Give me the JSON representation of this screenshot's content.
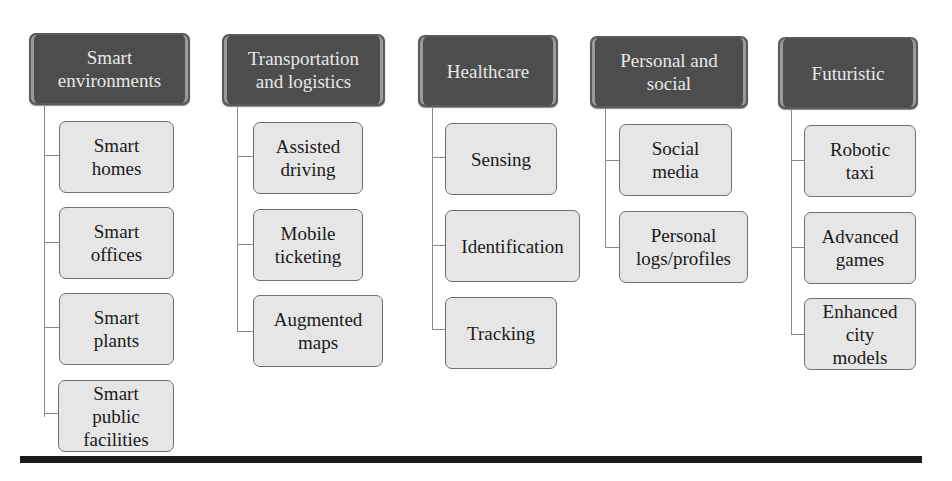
{
  "diagram": {
    "type": "category-tree",
    "columns": [
      {
        "title": "Smart\nenvironments",
        "items": [
          "Smart\nhomes",
          "Smart\noffices",
          "Smart\nplants",
          "Smart\npublic\nfacilities"
        ]
      },
      {
        "title": "Transportation\nand logistics",
        "items": [
          "Assisted\ndriving",
          "Mobile\nticketing",
          "Augmented\nmaps"
        ]
      },
      {
        "title": "Healthcare",
        "items": [
          "Sensing",
          "Identification",
          "Tracking"
        ]
      },
      {
        "title": "Personal and\nsocial",
        "items": [
          "Social\nmedia",
          "Personal\nlogs/profiles"
        ]
      },
      {
        "title": "Futuristic",
        "items": [
          "Robotic\ntaxi",
          "Advanced\ngames",
          "Enhanced\ncity\nmodels"
        ]
      }
    ]
  },
  "colors": {
    "header_bg": "#4d4d4d",
    "header_text": "#e8e8e8",
    "child_bg": "#e6e6e6",
    "child_border": "#6f6f6f",
    "connector": "#8a8a8a",
    "bottom_rule": "#1a1a1a"
  }
}
